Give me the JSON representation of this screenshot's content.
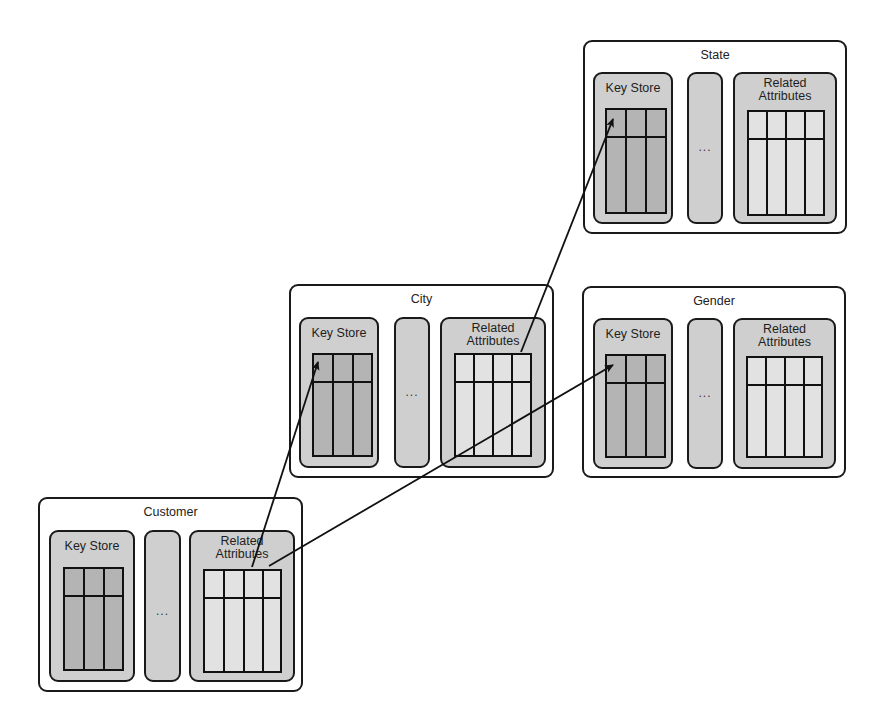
{
  "diagram": {
    "type": "attribute-store relationship diagram",
    "entities": [
      {
        "id": "state",
        "title": "State",
        "panels": {
          "key_store": "Key Store",
          "middle": "...",
          "related": [
            "Related",
            "Attributes"
          ]
        }
      },
      {
        "id": "city",
        "title": "City",
        "panels": {
          "key_store": "Key Store",
          "middle": "...",
          "related": [
            "Related",
            "Attributes"
          ]
        }
      },
      {
        "id": "gender",
        "title": "Gender",
        "panels": {
          "key_store": "Key Store",
          "middle": "...",
          "related": [
            "Related",
            "Attributes"
          ]
        }
      },
      {
        "id": "customer",
        "title": "Customer",
        "panels": {
          "key_store": "Key Store",
          "middle": "...",
          "related": [
            "Related",
            "Attributes"
          ]
        }
      }
    ],
    "edges": [
      {
        "from": "customer.related",
        "to": "city.key_store"
      },
      {
        "from": "customer.related",
        "to": "gender.key_store"
      },
      {
        "from": "city.related",
        "to": "state.key_store"
      }
    ],
    "table_layout": {
      "key_store_columns": 3,
      "related_columns": 4,
      "header_rows": 1
    },
    "colors": {
      "outline": "#1a1a1a",
      "panel_fill": "#cfcfcf",
      "key_table_fill": "#b4b4b4",
      "related_table_fill": "#e2e2e2"
    }
  }
}
